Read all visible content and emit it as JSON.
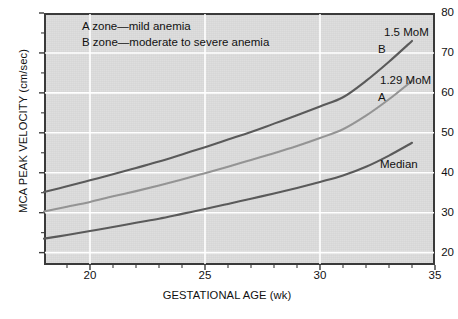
{
  "figure": {
    "background_color": "#ffffff",
    "plot_background_color": "#dcdcdc",
    "frame_color": "#3a3a3a",
    "gridline_color": "#ffffff"
  },
  "axes": {
    "y_title": "MCA PEAK VELOCITY (cm/sec)",
    "x_title": "GESTATIONAL AGE (wk)",
    "y_ticks": [
      "20",
      "30",
      "40",
      "50",
      "60",
      "70",
      "80"
    ],
    "x_ticks": [
      "20",
      "25",
      "30",
      "35"
    ]
  },
  "legend": {
    "line_a": "A zone—mild anemia",
    "line_b": "B zone—moderate to severe anemia"
  },
  "annotations": {
    "mom_b": "1.5 MoM",
    "label_b": "B",
    "mom_a": "1.29 MoM",
    "label_a": "A",
    "label_median": "Median"
  },
  "chart_data": {
    "type": "line",
    "title": "",
    "xlabel": "GESTATIONAL AGE (wk)",
    "ylabel": "MCA PEAK VELOCITY (cm/sec)",
    "xlim": [
      18,
      35
    ],
    "ylim": [
      16.9,
      80
    ],
    "xticks": [
      20,
      25,
      30,
      35
    ],
    "yticks": [
      20,
      30,
      40,
      50,
      60,
      70,
      80
    ],
    "grid": true,
    "legend_position": "inside-top-left",
    "x": [
      18,
      19,
      20,
      21,
      22,
      23,
      24,
      25,
      26,
      27,
      28,
      29,
      30,
      31,
      32,
      33,
      34
    ],
    "series": [
      {
        "name": "1.5 MoM",
        "zone_label": "B",
        "color": "#5a5a5a",
        "values": [
          35.2,
          36.6,
          38.1,
          39.6,
          41.2,
          42.8,
          44.6,
          46.4,
          48.3,
          50.2,
          52.3,
          54.4,
          56.6,
          58.9,
          63.0,
          67.8,
          73.0
        ]
      },
      {
        "name": "1.29 MoM",
        "zone_label": "A",
        "color": "#949494",
        "values": [
          30.3,
          31.5,
          32.7,
          34.1,
          35.4,
          36.8,
          38.3,
          39.9,
          41.5,
          43.2,
          44.9,
          46.7,
          48.7,
          50.9,
          54.3,
          58.4,
          63.0
        ]
      },
      {
        "name": "Median",
        "zone_label": "Median",
        "color": "#5a5a5a",
        "values": [
          23.5,
          24.4,
          25.4,
          26.4,
          27.5,
          28.5,
          29.7,
          30.9,
          32.2,
          33.5,
          34.8,
          36.2,
          37.7,
          39.3,
          41.5,
          44.3,
          47.5
        ]
      }
    ],
    "annotations": [
      {
        "text": "A zone—mild anemia",
        "type": "legend-line"
      },
      {
        "text": "B zone—moderate to severe anemia",
        "type": "legend-line"
      },
      {
        "text": "1.5 MoM",
        "type": "curve-label",
        "series": "1.5 MoM"
      },
      {
        "text": "B",
        "type": "curve-label",
        "series": "1.5 MoM"
      },
      {
        "text": "1.29 MoM",
        "type": "curve-label",
        "series": "1.29 MoM"
      },
      {
        "text": "A",
        "type": "curve-label",
        "series": "1.29 MoM"
      },
      {
        "text": "Median",
        "type": "curve-label",
        "series": "Median"
      }
    ]
  }
}
